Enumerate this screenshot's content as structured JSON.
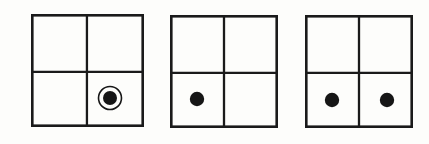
{
  "figure_set": {
    "title": "Three 2x2 grid diagrams with dot markers",
    "background_color": "#fdfdfb",
    "ink_color": "#161616",
    "figure_count": 3,
    "grid_rows": 2,
    "grid_columns": 2,
    "figures": [
      {
        "index": 1,
        "label": "figure-1",
        "x": 31,
        "y": 14,
        "width": 113,
        "height": 113,
        "divider_x_ratio": 0.495,
        "divider_y_ratio": 0.513,
        "cells": [
          {
            "row": 0,
            "col": 0,
            "name": "top-left",
            "marker": "none"
          },
          {
            "row": 0,
            "col": 1,
            "name": "top-right",
            "marker": "none"
          },
          {
            "row": 1,
            "col": 0,
            "name": "bottom-left",
            "marker": "none"
          },
          {
            "row": 1,
            "col": 1,
            "name": "bottom-right",
            "marker": "ringed-dot"
          }
        ],
        "markers": [
          {
            "type": "ringed-dot",
            "cell": "bottom-right",
            "cx": 110,
            "cy": 98,
            "dot_radius": 7,
            "gap_radius": 9.6,
            "ring_radius": 11.5
          }
        ]
      },
      {
        "index": 2,
        "label": "figure-2",
        "x": 170,
        "y": 15,
        "width": 108,
        "height": 113,
        "divider_x_ratio": 0.5,
        "divider_y_ratio": 0.513,
        "cells": [
          {
            "row": 0,
            "col": 0,
            "name": "top-left",
            "marker": "none"
          },
          {
            "row": 0,
            "col": 1,
            "name": "top-right",
            "marker": "none"
          },
          {
            "row": 1,
            "col": 0,
            "name": "bottom-left",
            "marker": "dot"
          },
          {
            "row": 1,
            "col": 1,
            "name": "bottom-right",
            "marker": "none"
          }
        ],
        "markers": [
          {
            "type": "dot",
            "cell": "bottom-left",
            "cx": 197,
            "cy": 99,
            "dot_radius": 7.2
          }
        ]
      },
      {
        "index": 3,
        "label": "figure-3",
        "x": 305,
        "y": 15,
        "width": 108,
        "height": 113,
        "divider_x_ratio": 0.5,
        "divider_y_ratio": 0.513,
        "cells": [
          {
            "row": 0,
            "col": 0,
            "name": "top-left",
            "marker": "none"
          },
          {
            "row": 0,
            "col": 1,
            "name": "top-right",
            "marker": "none"
          },
          {
            "row": 1,
            "col": 0,
            "name": "bottom-left",
            "marker": "dot"
          },
          {
            "row": 1,
            "col": 1,
            "name": "bottom-right",
            "marker": "dot"
          }
        ],
        "markers": [
          {
            "type": "dot",
            "cell": "bottom-left",
            "cx": 332,
            "cy": 100,
            "dot_radius": 7.2
          },
          {
            "type": "dot",
            "cell": "bottom-right",
            "cx": 387,
            "cy": 100,
            "dot_radius": 7.2
          }
        ]
      }
    ]
  }
}
